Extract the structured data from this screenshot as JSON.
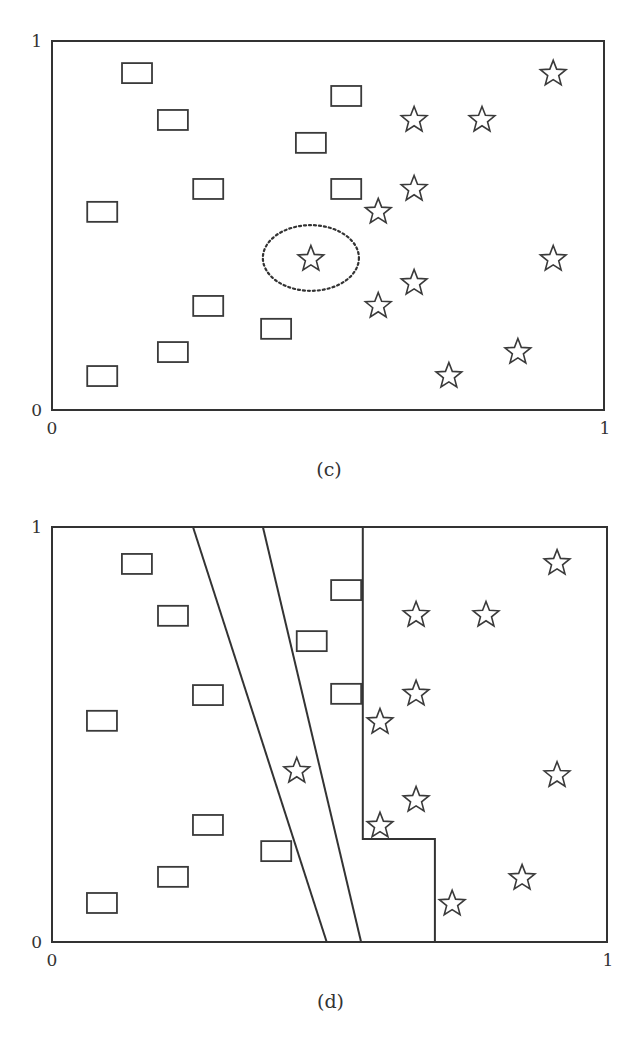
{
  "chart_data": [
    {
      "id": "c",
      "type": "scatter",
      "caption": "(c)",
      "title": "",
      "xlabel": "",
      "ylabel": "",
      "xlim": [
        0,
        1
      ],
      "ylim": [
        0,
        1
      ],
      "grid": false,
      "legend": null,
      "tick_labels": {
        "x_min": "0",
        "x_max": "1",
        "y_min": "0",
        "y_max": "1"
      },
      "frame_px": {
        "left": 52,
        "right": 604,
        "top": 41,
        "bottom": 410
      },
      "series": [
        {
          "name": "rectangles",
          "marker": "rectangle",
          "points": [
            [
              0.154,
              0.913
            ],
            [
              0.219,
              0.786
            ],
            [
              0.533,
              0.851
            ],
            [
              0.469,
              0.724
            ],
            [
              0.283,
              0.599
            ],
            [
              0.533,
              0.599
            ],
            [
              0.091,
              0.537
            ],
            [
              0.283,
              0.282
            ],
            [
              0.406,
              0.22
            ],
            [
              0.219,
              0.157
            ],
            [
              0.091,
              0.092
            ]
          ]
        },
        {
          "name": "stars",
          "marker": "star",
          "points": [
            [
              0.908,
              0.911
            ],
            [
              0.656,
              0.786
            ],
            [
              0.779,
              0.786
            ],
            [
              0.656,
              0.599
            ],
            [
              0.591,
              0.537
            ],
            [
              0.469,
              0.409
            ],
            [
              0.908,
              0.409
            ],
            [
              0.656,
              0.344
            ],
            [
              0.591,
              0.282
            ],
            [
              0.844,
              0.157
            ],
            [
              0.719,
              0.092
            ]
          ]
        }
      ],
      "annotations": [
        {
          "type": "dotted-ellipse",
          "center": [
            0.469,
            0.412
          ],
          "rx": 0.087,
          "ry": 0.089,
          "note": "circles the star outlier among rectangles"
        }
      ],
      "boundaries": []
    },
    {
      "id": "d",
      "type": "scatter",
      "caption": "(d)",
      "title": "",
      "xlabel": "",
      "ylabel": "",
      "xlim": [
        0,
        1
      ],
      "ylim": [
        0,
        1
      ],
      "grid": false,
      "legend": null,
      "tick_labels": {
        "x_min": "0",
        "x_max": "1",
        "y_min": "0",
        "y_max": "1"
      },
      "frame_px": {
        "left": 52,
        "right": 607,
        "top": 527,
        "bottom": 942
      },
      "series": [
        {
          "name": "rectangles",
          "marker": "rectangle",
          "points": [
            [
              0.153,
              0.911
            ],
            [
              0.218,
              0.786
            ],
            [
              0.53,
              0.848
            ],
            [
              0.468,
              0.725
            ],
            [
              0.281,
              0.595
            ],
            [
              0.53,
              0.598
            ],
            [
              0.09,
              0.533
            ],
            [
              0.281,
              0.282
            ],
            [
              0.404,
              0.219
            ],
            [
              0.218,
              0.157
            ],
            [
              0.09,
              0.094
            ]
          ]
        },
        {
          "name": "stars",
          "marker": "star",
          "points": [
            [
              0.91,
              0.913
            ],
            [
              0.656,
              0.788
            ],
            [
              0.782,
              0.788
            ],
            [
              0.656,
              0.598
            ],
            [
              0.591,
              0.53
            ],
            [
              0.441,
              0.412
            ],
            [
              0.91,
              0.402
            ],
            [
              0.656,
              0.342
            ],
            [
              0.591,
              0.28
            ],
            [
              0.847,
              0.154
            ],
            [
              0.721,
              0.092
            ]
          ]
        }
      ],
      "annotations": [],
      "boundaries": [
        {
          "name": "diagonal-boundary-left",
          "points": [
            [
              0.254,
              1.0
            ],
            [
              0.495,
              0.0
            ]
          ]
        },
        {
          "name": "diagonal-boundary-right",
          "points": [
            [
              0.38,
              1.0
            ],
            [
              0.557,
              0.0
            ]
          ]
        },
        {
          "name": "step-boundary",
          "points": [
            [
              0.56,
              1.0
            ],
            [
              0.56,
              0.248
            ],
            [
              0.69,
              0.248
            ],
            [
              0.69,
              0.0
            ]
          ]
        }
      ]
    }
  ],
  "style": {
    "line_color": "#333333",
    "marker_stroke": "#3a3a3a",
    "background": "#ffffff"
  }
}
